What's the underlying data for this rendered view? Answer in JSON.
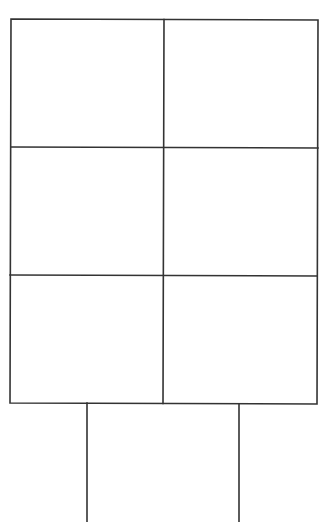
{
  "diagram": {
    "stroke_color": "#333333",
    "background_color": "#ffffff",
    "grid": {
      "rows": 3,
      "columns": 2,
      "cells": [
        {
          "row": 1,
          "col": 1,
          "text": ""
        },
        {
          "row": 1,
          "col": 2,
          "text": ""
        },
        {
          "row": 2,
          "col": 1,
          "text": ""
        },
        {
          "row": 2,
          "col": 2,
          "text": ""
        },
        {
          "row": 3,
          "col": 1,
          "text": ""
        },
        {
          "row": 3,
          "col": 2,
          "text": ""
        }
      ]
    },
    "stem": {
      "open_bottom": true
    }
  }
}
